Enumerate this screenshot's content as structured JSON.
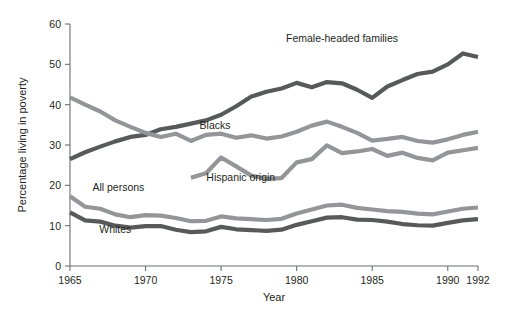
{
  "chart_data": {
    "type": "line",
    "title": "",
    "xlabel": "Year",
    "ylabel": "Percentage living in poverty",
    "xlim": [
      1965,
      1992
    ],
    "ylim": [
      0,
      60
    ],
    "xticks": [
      1965,
      1970,
      1975,
      1980,
      1985,
      1990,
      1992
    ],
    "yticks": [
      0,
      10,
      20,
      30,
      40,
      50,
      60
    ],
    "grid": false,
    "legend": "inline-labels",
    "series": [
      {
        "name": "Female-headed families",
        "color": "#58595b",
        "label_x": 1983.0,
        "label_y": 55.5,
        "x": [
          1965,
          1966,
          1967,
          1968,
          1969,
          1970,
          1971,
          1972,
          1973,
          1974,
          1975,
          1976,
          1977,
          1978,
          1979,
          1980,
          1981,
          1982,
          1983,
          1984,
          1985,
          1986,
          1987,
          1988,
          1989,
          1990,
          1991,
          1992
        ],
        "values": [
          26.5,
          28.2,
          29.6,
          30.9,
          32.0,
          32.5,
          33.9,
          34.5,
          35.3,
          36.1,
          37.5,
          39.6,
          42.0,
          43.2,
          44.0,
          45.4,
          44.3,
          45.6,
          45.3,
          43.7,
          41.7,
          44.5,
          46.1,
          47.6,
          48.2,
          50.0,
          52.7,
          51.8
        ]
      },
      {
        "name": "Blacks",
        "color": "#939598",
        "label_x": 1974.6,
        "label_y": 34.0,
        "x": [
          1965,
          1966,
          1967,
          1968,
          1969,
          1970,
          1971,
          1972,
          1973,
          1974,
          1975,
          1976,
          1977,
          1978,
          1979,
          1980,
          1981,
          1982,
          1983,
          1984,
          1985,
          1986,
          1987,
          1988,
          1989,
          1990,
          1991,
          1992
        ],
        "values": [
          41.8,
          40.0,
          38.3,
          36.1,
          34.5,
          33.0,
          32.0,
          32.8,
          31.0,
          32.5,
          32.8,
          31.8,
          32.4,
          31.6,
          32.1,
          33.3,
          34.8,
          35.8,
          34.5,
          33.0,
          31.1,
          31.5,
          32.0,
          31.0,
          30.6,
          31.4,
          32.5,
          33.3
        ]
      },
      {
        "name": "Hispanic origin",
        "color": "#939598",
        "label_x": 1976.3,
        "label_y": 21.0,
        "x": [
          1973,
          1974,
          1975,
          1976,
          1977,
          1978,
          1979,
          1980,
          1981,
          1982,
          1983,
          1984,
          1985,
          1986,
          1987,
          1988,
          1989,
          1990,
          1991,
          1992
        ],
        "values": [
          21.9,
          23.0,
          26.9,
          24.7,
          22.4,
          21.6,
          21.8,
          25.7,
          26.5,
          29.9,
          28.0,
          28.4,
          29.0,
          27.3,
          28.1,
          26.8,
          26.2,
          28.1,
          28.7,
          29.3
        ]
      },
      {
        "name": "All persons",
        "color": "#939598",
        "label_x": 1968.2,
        "label_y": 18.6,
        "x": [
          1965,
          1966,
          1967,
          1968,
          1969,
          1970,
          1971,
          1972,
          1973,
          1974,
          1975,
          1976,
          1977,
          1978,
          1979,
          1980,
          1981,
          1982,
          1983,
          1984,
          1985,
          1986,
          1987,
          1988,
          1989,
          1990,
          1991,
          1992
        ],
        "values": [
          17.3,
          14.7,
          14.2,
          12.8,
          12.1,
          12.6,
          12.5,
          11.9,
          11.1,
          11.2,
          12.3,
          11.8,
          11.6,
          11.4,
          11.7,
          13.0,
          14.0,
          15.0,
          15.2,
          14.4,
          14.0,
          13.6,
          13.4,
          13.0,
          12.8,
          13.5,
          14.2,
          14.5
        ]
      },
      {
        "name": "Whites",
        "color": "#58595b",
        "label_x": 1968.0,
        "label_y": 8.2,
        "x": [
          1965,
          1966,
          1967,
          1968,
          1969,
          1970,
          1971,
          1972,
          1973,
          1974,
          1975,
          1976,
          1977,
          1978,
          1979,
          1980,
          1981,
          1982,
          1983,
          1984,
          1985,
          1986,
          1987,
          1988,
          1989,
          1990,
          1991,
          1992
        ],
        "values": [
          13.3,
          11.3,
          11.0,
          10.0,
          9.5,
          9.9,
          9.9,
          9.0,
          8.4,
          8.6,
          9.7,
          9.1,
          8.9,
          8.7,
          9.0,
          10.2,
          11.1,
          12.0,
          12.1,
          11.5,
          11.4,
          11.0,
          10.4,
          10.1,
          10.0,
          10.7,
          11.3,
          11.6
        ]
      }
    ]
  }
}
